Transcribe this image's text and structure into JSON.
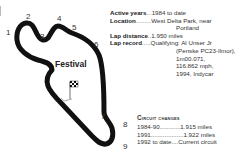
{
  "map": {
    "circuit_name": "Festival",
    "corners": [
      "1",
      "2",
      "3",
      "4",
      "5",
      "6",
      "7",
      "8",
      "9"
    ],
    "icons": [
      "track-outline",
      "checkered-flag-icon",
      "start-finish-line"
    ]
  },
  "info": {
    "active_years": {
      "label": "Active years",
      "dots": "...",
      "value": "1984 to date"
    },
    "location": {
      "label": "Location",
      "dots": ".........",
      "value": "West Delta Park, near",
      "value2": "Portland"
    },
    "lap_distance": {
      "label": "Lap distance",
      "dots": "..",
      "value": "1.950 miles"
    },
    "lap_record": {
      "label": "Lap record",
      "dots": ".....",
      "value": "Qualifying: Al Unser Jr",
      "lines": [
        "(Penske PC23-Ilmor),",
        "1m00.071,",
        "116.862 mph,",
        "1994, Indycar"
      ]
    }
  },
  "circuit_changes": {
    "title": "Circuit changes",
    "rows": [
      {
        "period": "1984-90",
        "dots": "............",
        "value": "1.915 miles"
      },
      {
        "period": "1991",
        "dots": "...................",
        "value": "1.922 miles"
      },
      {
        "period": "1992 to date",
        "dots": "....",
        "value": "Current circuit"
      }
    ]
  }
}
